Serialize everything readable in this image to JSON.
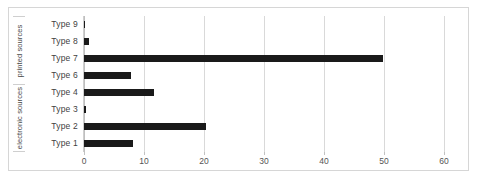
{
  "chart_data": {
    "type": "bar",
    "orientation": "horizontal",
    "title": "",
    "xlabel": "",
    "ylabel": "",
    "xlim": [
      0,
      60
    ],
    "grid": true,
    "legend": "none",
    "xticks": [
      0,
      10,
      20,
      30,
      40,
      50,
      60
    ],
    "xtick_labels": [
      "0",
      "10",
      "20",
      "30",
      "40",
      "50",
      "60"
    ],
    "categories": [
      "Type 1",
      "Type 2",
      "Type 3",
      "Type 4",
      "Type 6",
      "Type 7",
      "Type 8",
      "Type 9"
    ],
    "values": [
      8.2,
      20.3,
      0.3,
      11.6,
      7.8,
      49.8,
      0.9,
      0.2
    ],
    "bar_color": "#1a1a1a",
    "groups": [
      {
        "label": "electronic sources",
        "categories": [
          "Type 1",
          "Type 2",
          "Type 3",
          "Type 4"
        ]
      },
      {
        "label": "printed sources",
        "categories": [
          "Type 6",
          "Type 7",
          "Type 8",
          "Type 9"
        ]
      }
    ],
    "rows_top_to_bottom": [
      {
        "group": "printed sources",
        "category": "Type 9",
        "value": 0.2
      },
      {
        "group": "printed sources",
        "category": "Type 8",
        "value": 0.9
      },
      {
        "group": "printed sources",
        "category": "Type 7",
        "value": 49.8
      },
      {
        "group": "printed sources",
        "category": "Type 6",
        "value": 7.8
      },
      {
        "group": "electronic sources",
        "category": "Type 4",
        "value": 11.6
      },
      {
        "group": "electronic sources",
        "category": "Type 3",
        "value": 0.3
      },
      {
        "group": "electronic sources",
        "category": "Type 2",
        "value": 20.3
      },
      {
        "group": "electronic sources",
        "category": "Type 1",
        "value": 8.2
      }
    ]
  },
  "axis": {
    "category_labels_top_to_bottom": [
      "Type 9",
      "Type 8",
      "Type 7",
      "Type 6",
      "Type 4",
      "Type 3",
      "Type 2",
      "Type 1"
    ],
    "group_labels_top_to_bottom": [
      "printed sources",
      "electronic sources"
    ]
  },
  "colors": {
    "bar": "#1a1a1a",
    "gridline": "#d9d9d9",
    "axis_line": "#bfbfbf",
    "frame_border": "#d6d6d6",
    "tick_text": "#545454",
    "category_text": "#3f3f3f",
    "group_text": "#4a4a4a",
    "background": "#ffffff"
  }
}
